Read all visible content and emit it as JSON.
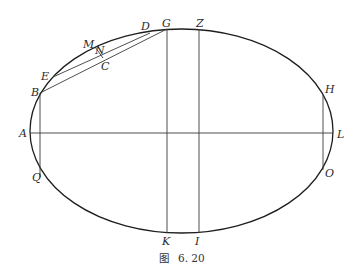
{
  "figure": {
    "caption_prefix": "图",
    "caption_number": "6. 20",
    "colors": {
      "curve": "#1e1e1e",
      "lines": "#3a3a3a",
      "labels": "#2a2a2a",
      "background": "#ffffff"
    }
  },
  "labels": {
    "A": "A",
    "B": "B",
    "C": "C",
    "D": "D",
    "E": "E",
    "G": "G",
    "H": "H",
    "I": "I",
    "K": "K",
    "L": "L",
    "M": "M",
    "N": "N",
    "O": "O",
    "Q": "Q",
    "Z": "Z"
  },
  "geometry": {
    "ellipse": {
      "cx": 181.5,
      "cy": 131,
      "rx": 151.5,
      "ry": 102
    },
    "points": {
      "A": [
        30,
        133
      ],
      "L": [
        333,
        133
      ],
      "B": [
        40,
        93
      ],
      "Q": [
        40,
        177
      ],
      "E": [
        53,
        77
      ],
      "D": [
        150,
        33
      ],
      "G": [
        167,
        29
      ],
      "K": [
        167,
        233
      ],
      "Z": [
        199,
        29
      ],
      "I": [
        199,
        233
      ],
      "H": [
        323,
        95
      ],
      "O": [
        323,
        170
      ],
      "M": [
        95,
        47
      ],
      "C": [
        103,
        58
      ]
    },
    "segments": [
      [
        "A",
        "L"
      ],
      [
        "B",
        "Q"
      ],
      [
        "G",
        "K"
      ],
      [
        "Z",
        "I"
      ],
      [
        "H",
        "O"
      ],
      [
        "B",
        "G"
      ],
      [
        "E",
        "D"
      ],
      [
        "M",
        "C"
      ]
    ]
  }
}
